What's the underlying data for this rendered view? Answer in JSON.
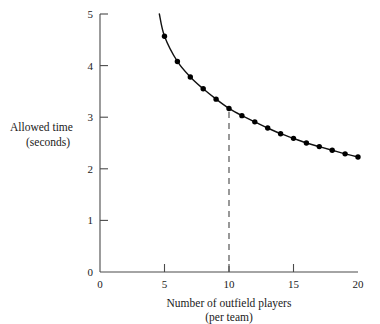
{
  "chart_data": {
    "type": "line",
    "title": "",
    "xlabel": "Number of outfield players",
    "xlabel_line2": "(per team)",
    "ylabel": "Allowed time",
    "ylabel_line2": "(seconds)",
    "xlim": [
      0,
      20
    ],
    "ylim": [
      0,
      5
    ],
    "xticks": [
      0,
      5,
      10,
      15,
      20
    ],
    "xtick_labels": [
      "0",
      "5",
      "10",
      "15",
      "20"
    ],
    "yticks": [
      0,
      1,
      2,
      3,
      4,
      5
    ],
    "ytick_labels": [
      "0",
      "1",
      "2",
      "3",
      "4",
      "5"
    ],
    "grid": false,
    "legend": "none",
    "marker": "filled-circle",
    "curve_start": {
      "x": 4.6,
      "y": 5.0
    },
    "x": [
      5,
      6,
      7,
      8,
      9,
      10,
      11,
      12,
      13,
      14,
      15,
      16,
      17,
      18,
      19,
      20
    ],
    "values": [
      4.57,
      4.08,
      3.78,
      3.55,
      3.35,
      3.17,
      3.03,
      2.91,
      2.79,
      2.68,
      2.59,
      2.5,
      2.43,
      2.36,
      2.29,
      2.23
    ],
    "series": [
      {
        "name": "Allowed time",
        "values": [
          4.57,
          4.08,
          3.78,
          3.55,
          3.35,
          3.17,
          3.03,
          2.91,
          2.79,
          2.68,
          2.59,
          2.5,
          2.43,
          2.36,
          2.29,
          2.23
        ]
      }
    ],
    "annotations": [
      {
        "type": "vertical-dashed-line",
        "x": 10,
        "y_from": 0,
        "y_to": 3.17,
        "label": ""
      }
    ],
    "colors": {
      "curve": "#111111",
      "marker": "#000000",
      "axis": "#4a4a4a",
      "refline": "#555555",
      "background": "#ffffff"
    }
  }
}
